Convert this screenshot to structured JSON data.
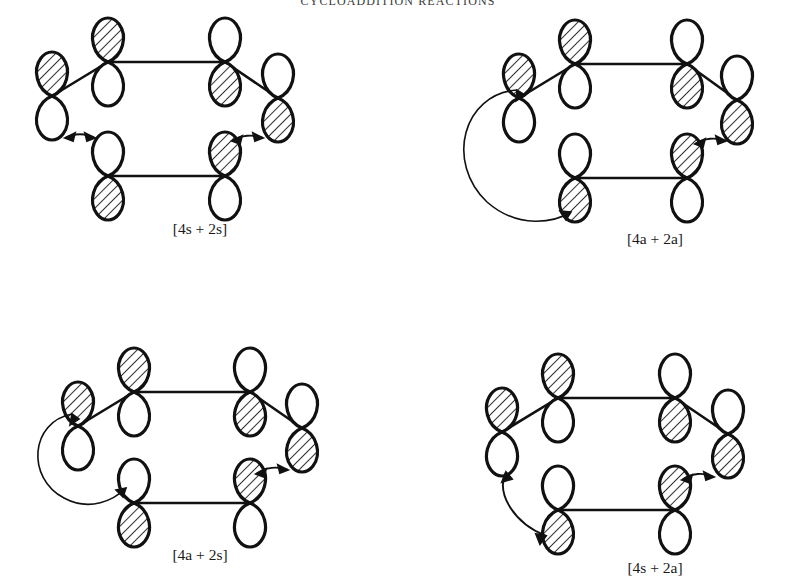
{
  "page": {
    "running_head": "CYCLOADDITION REACTIONS",
    "ink_color": "#111111",
    "background_color": "#ffffff"
  },
  "figure": {
    "panels": [
      {
        "id": "panel-1",
        "caption": "[4s + 2s]",
        "diene_component": "4s",
        "dienophile_component": "2s",
        "arrows": 2,
        "arrow_style": "short double-headed",
        "diene_lobes_top": [
          "shaded",
          "white",
          "white",
          "shaded"
        ],
        "dienophile_lobes_top": [
          "white",
          "shaded"
        ]
      },
      {
        "id": "panel-2",
        "caption": "[4a + 2a]",
        "diene_component": "4a",
        "dienophile_component": "2a",
        "arrows": 2,
        "arrow_style": "one long wrap-around, one short double-headed",
        "diene_lobes_top": [
          "shaded",
          "white",
          "white",
          "shaded"
        ],
        "dienophile_lobes_top": [
          "white",
          "shaded"
        ]
      },
      {
        "id": "panel-3",
        "caption": "[4a + 2s]",
        "diene_component": "4a",
        "dienophile_component": "2s",
        "arrows": 2,
        "arrow_style": "one long wrap-around, one short double-headed",
        "diene_lobes_top": [
          "shaded",
          "white",
          "white",
          "shaded"
        ],
        "dienophile_lobes_top": [
          "white",
          "shaded"
        ]
      },
      {
        "id": "panel-4",
        "caption": "[4s + 2a]",
        "diene_component": "4s",
        "dienophile_component": "2a",
        "arrows": 2,
        "arrow_style": "one medium curved, one short double-headed",
        "diene_lobes_top": [
          "shaded",
          "white",
          "white",
          "shaded"
        ],
        "dienophile_lobes_top": [
          "white",
          "shaded"
        ]
      }
    ]
  }
}
